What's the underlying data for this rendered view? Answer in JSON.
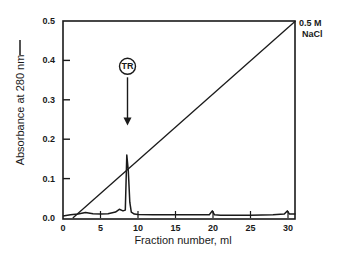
{
  "chart_data": {
    "type": "line",
    "title": "",
    "xlabel": "Fraction number, ml",
    "ylabel": "Absorbance at 280 nm",
    "xlim": [
      0,
      31
    ],
    "ylim": [
      0.0,
      0.5
    ],
    "x_ticks": [
      "0",
      "5",
      "10",
      "15",
      "20",
      "25",
      "30"
    ],
    "y_ticks": [
      "0.0",
      "0.1",
      "0.2",
      "0.3",
      "0.4",
      "0.5"
    ],
    "grid": false,
    "legend": null,
    "series": [
      {
        "name": "Absorbance at 280 nm",
        "style": "solid",
        "x": [
          0,
          1,
          2,
          3,
          4,
          5,
          6,
          7,
          7.5,
          8,
          8.3,
          8.5,
          8.7,
          8.9,
          9.1,
          9.5,
          10,
          12,
          15,
          19.5,
          19.9,
          20.2,
          21,
          25,
          28,
          29.5,
          29.9,
          30.2,
          31
        ],
        "y": [
          0.005,
          0.008,
          0.01,
          0.014,
          0.011,
          0.01,
          0.011,
          0.015,
          0.022,
          0.018,
          0.02,
          0.16,
          0.12,
          0.04,
          0.015,
          0.01,
          0.009,
          0.008,
          0.008,
          0.008,
          0.018,
          0.008,
          0.007,
          0.007,
          0.008,
          0.01,
          0.018,
          0.01,
          0.01
        ]
      },
      {
        "name": "NaCl gradient",
        "style": "solid",
        "x": [
          1.3,
          31
        ],
        "y": [
          0.0,
          0.5
        ],
        "end_label": "0.5 M NaCl"
      }
    ],
    "annotations": [
      {
        "text": "TR",
        "shape": "circle",
        "x": 8.6,
        "y": 0.385,
        "arrow_to": {
          "x": 8.6,
          "y": 0.235
        }
      },
      {
        "text": "0.5 M",
        "x": 31,
        "y": 0.5
      },
      {
        "text": "NaCl",
        "x": 31,
        "y": 0.48
      }
    ]
  },
  "labels": {
    "xlabel": "Fraction number, ml",
    "ylabel": "Absorbance at 280 nm",
    "nacl_line1": "0.5 M",
    "nacl_line2": "NaCl",
    "peak_label": "TR"
  }
}
